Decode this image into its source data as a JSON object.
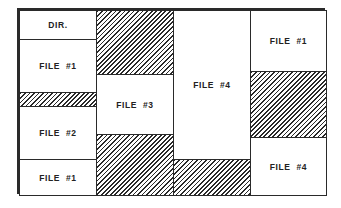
{
  "diagram": {
    "type": "disk-allocation-map",
    "colors": {
      "border": "#2a2a2a",
      "file_fill": "#ffffff",
      "free_hatch": "#2a2a2a"
    },
    "columns": [
      {
        "blocks": [
          {
            "kind": "file",
            "label": "DIR."
          },
          {
            "kind": "file",
            "label": "FILE  #1"
          },
          {
            "kind": "free",
            "label": ""
          },
          {
            "kind": "file",
            "label": "FILE  #2"
          },
          {
            "kind": "file",
            "label": "FILE  #1"
          }
        ]
      },
      {
        "blocks": [
          {
            "kind": "free",
            "label": ""
          },
          {
            "kind": "file",
            "label": "FILE  #3"
          },
          {
            "kind": "free",
            "label": ""
          }
        ]
      },
      {
        "blocks": [
          {
            "kind": "file",
            "label": "FILE  #4"
          },
          {
            "kind": "free",
            "label": ""
          }
        ]
      },
      {
        "blocks": [
          {
            "kind": "file",
            "label": "FILE  #1"
          },
          {
            "kind": "free",
            "label": ""
          },
          {
            "kind": "file",
            "label": "FILE  #4"
          }
        ]
      }
    ]
  }
}
